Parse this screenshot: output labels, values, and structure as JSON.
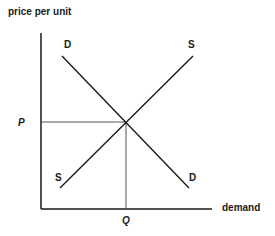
{
  "diagram": {
    "y_axis_label": "price per unit",
    "x_axis_label": "demand",
    "equilibrium_price_label": "P",
    "equilibrium_quantity_label": "Q",
    "demand_curve": {
      "top_label": "D",
      "bottom_label": "D"
    },
    "supply_curve": {
      "top_label": "S",
      "bottom_label": "S"
    },
    "colors": {
      "axis": "#1a1a1a",
      "curve": "#1a1a1a",
      "guide": "#555555",
      "background": "#ffffff"
    }
  }
}
